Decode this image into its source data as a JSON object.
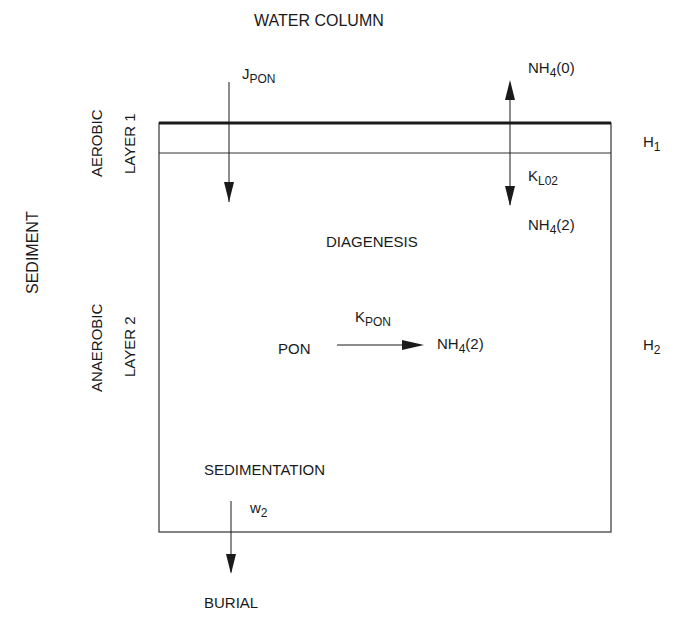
{
  "diagram": {
    "top_label": "WATER COLUMN",
    "side_label": "SEDIMENT",
    "layer1": {
      "type": "AEROBIC",
      "name": "LAYER 1",
      "thickness": {
        "base": "H",
        "sub": "1"
      }
    },
    "layer2": {
      "type": "ANAEROBIC",
      "name": "LAYER 2",
      "thickness": {
        "base": "H",
        "sub": "2"
      }
    },
    "flux_in": {
      "base": "J",
      "sub": "PON"
    },
    "nh4_top": {
      "base": "NH",
      "sub": "4",
      "tail": "(0)"
    },
    "mass_transfer": {
      "base": "K",
      "sub": "L02"
    },
    "nh4_layer2_top": {
      "base": "NH",
      "sub": "4",
      "tail": "(2)"
    },
    "process": "DIAGENESIS",
    "reactant": "PON",
    "rate": {
      "base": "K",
      "sub": "PON"
    },
    "product": {
      "base": "NH",
      "sub": "4",
      "tail": "(2)"
    },
    "sedimentation": "SEDIMENTATION",
    "velocity": {
      "base": "w",
      "sub": "2"
    },
    "sink": "BURIAL"
  }
}
